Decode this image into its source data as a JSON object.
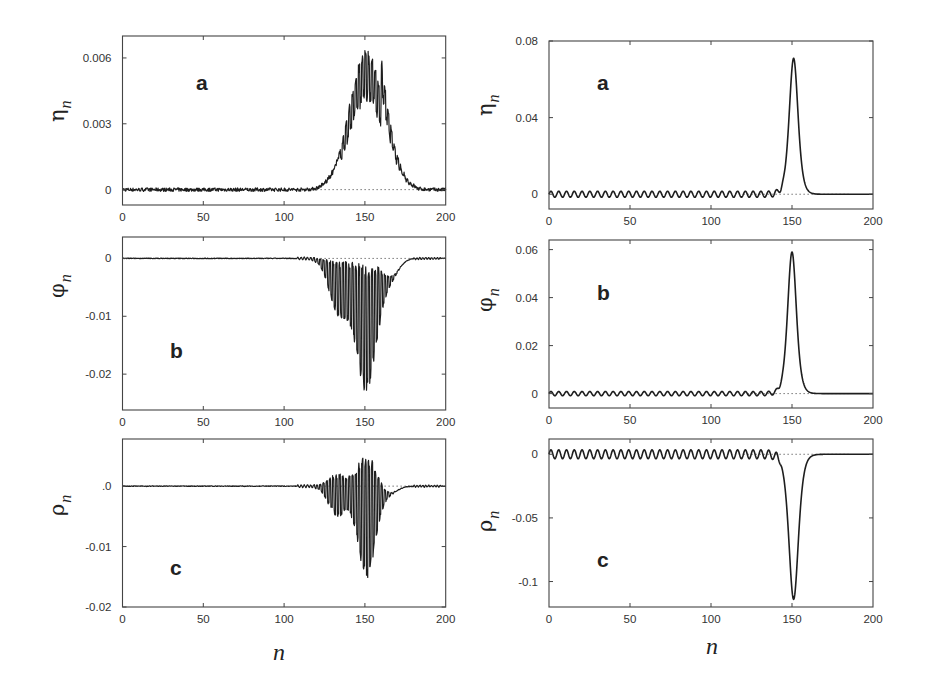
{
  "figure": {
    "xlabel": "n",
    "columns": [
      "left",
      "right"
    ]
  },
  "chart_data": [
    {
      "id": "left-a",
      "type": "line",
      "panel_letter": "a",
      "ylabel_main": "η",
      "ylabel_sub": "n",
      "xlabel": "",
      "xlim": [
        0,
        200
      ],
      "ylim": [
        -0.0007,
        0.007
      ],
      "xticks": [
        0,
        50,
        100,
        150,
        200
      ],
      "xtick_labels": [
        "0",
        "50",
        "100",
        "150",
        "200"
      ],
      "yticks": [
        0,
        0.003,
        0.006
      ],
      "ytick_labels": [
        "0",
        "0.003",
        "0.006"
      ],
      "zero_reference_line": true,
      "description": "Noisy near-zero baseline for n<120, then jagged oscillating bump peaking ~0.0067 at n≈152, decaying to 0 by n≈180",
      "shape": {
        "kind": "noisy-bump",
        "center": 151,
        "width": 10.5,
        "amplitude": 0.0052,
        "oscillation": 0.0012,
        "period": 2,
        "baseline_noise": 8e-05,
        "tail_start": 160,
        "tail_end": 182
      },
      "x": [
        0,
        20,
        40,
        60,
        80,
        100,
        120,
        125,
        130,
        135,
        140,
        145,
        148,
        150,
        152,
        155,
        158,
        162,
        166,
        170,
        175,
        180,
        190,
        200
      ],
      "y": [
        0,
        0.0001,
        0,
        0.0001,
        0,
        0,
        0.0001,
        0.0003,
        0.0006,
        0.0014,
        0.0025,
        0.0045,
        0.0055,
        0.006,
        0.0067,
        0.0055,
        0.0052,
        0.0035,
        0.0018,
        0.0012,
        0.0004,
        0.0001,
        0,
        0
      ],
      "frame_px": {
        "x0": 122.5,
        "x1": 445.7,
        "top": 36,
        "bottom": 205
      }
    },
    {
      "id": "left-b",
      "type": "line",
      "panel_letter": "b",
      "ylabel_main": "φ",
      "ylabel_sub": "n",
      "xlabel": "",
      "xlim": [
        0,
        200
      ],
      "ylim": [
        -0.0262,
        0.0037
      ],
      "xticks": [
        0,
        50,
        100,
        150,
        200
      ],
      "xtick_labels": [
        "0",
        "50",
        "100",
        "150",
        "200"
      ],
      "yticks": [
        0,
        -0.01,
        -0.02
      ],
      "ytick_labels": [
        "0",
        "-0.01",
        "-0.02"
      ],
      "zero_reference_line": true,
      "description": "Near-zero baseline, then two rapidly oscillating negative lobes: first around n≈130-140 (min ~ -0.008), second around n≈150 reaching ~ -0.023, positive spikes up to ~+0.003",
      "shape": {
        "kind": "oscillating-dip",
        "lobes": [
          {
            "center": 134,
            "width": 6,
            "depth": -0.005,
            "osc": 0.0045
          },
          {
            "center": 151,
            "width": 6.5,
            "depth": -0.012,
            "osc": 0.011
          }
        ],
        "tail_center": 166,
        "tail_depth": -0.003,
        "period": 2
      },
      "x": [
        0,
        50,
        100,
        120,
        128,
        133,
        138,
        143,
        148,
        150,
        152,
        156,
        160,
        165,
        170,
        180,
        190,
        200
      ],
      "y": [
        0,
        0,
        0,
        0,
        -0.002,
        -0.005,
        -0.007,
        -0.006,
        -0.015,
        -0.023,
        -0.022,
        -0.012,
        -0.006,
        -0.003,
        -0.001,
        0,
        0,
        0
      ],
      "frame_px": {
        "x0": 122.5,
        "x1": 445.7,
        "top": 237,
        "bottom": 410
      }
    },
    {
      "id": "left-c",
      "type": "line",
      "panel_letter": "c",
      "ylabel_main": "ρ",
      "ylabel_sub": "n",
      "xlabel": "n",
      "xlim": [
        0,
        200
      ],
      "ylim": [
        -0.02,
        0.0078
      ],
      "xticks": [
        0,
        50,
        100,
        150,
        200
      ],
      "xtick_labels": [
        "0",
        "50",
        "100",
        "150",
        "200"
      ],
      "yticks": [
        0,
        -0.01,
        -0.02
      ],
      "ytick_labels": ".0|-0.01|-0.02",
      "zero_reference_line": true,
      "description": "Near-zero baseline, rapidly oscillating packets around n≈133 (±0.003) and n≈150 (min ~ -0.016, max ~ +0.006)",
      "shape": {
        "kind": "oscillating-dip",
        "lobes": [
          {
            "center": 133,
            "width": 5.5,
            "depth": -0.0015,
            "osc": 0.0035
          },
          {
            "center": 151,
            "width": 5.5,
            "depth": -0.005,
            "osc": 0.0105
          }
        ],
        "tail_center": 165,
        "tail_depth": -0.0012,
        "period": 2
      },
      "x": [
        0,
        50,
        100,
        120,
        128,
        133,
        138,
        143,
        148,
        150,
        152,
        156,
        160,
        165,
        170,
        180,
        190,
        200
      ],
      "y": [
        0,
        0,
        0,
        0,
        0.002,
        0.003,
        -0.004,
        -0.002,
        -0.012,
        0.006,
        -0.016,
        -0.01,
        -0.004,
        -0.002,
        -0.0008,
        0,
        0,
        0
      ],
      "frame_px": {
        "x0": 122.5,
        "x1": 445.7,
        "top": 439,
        "bottom": 607
      }
    },
    {
      "id": "right-a",
      "type": "line",
      "panel_letter": "a",
      "ylabel_main": "η",
      "ylabel_sub": "n",
      "xlabel": "",
      "xlim": [
        0,
        200
      ],
      "ylim": [
        -0.0077,
        0.08
      ],
      "xticks": [
        0,
        50,
        100,
        150,
        200
      ],
      "xtick_labels": [
        "0",
        "50",
        "100",
        "150",
        "200"
      ],
      "yticks": [
        0,
        0.04,
        0.08
      ],
      "ytick_labels": [
        "0",
        "0.04",
        "0.08"
      ],
      "zero_reference_line": true,
      "description": "Small regular sinusoidal ripple (amplitude ~0.0015, period ~4.8) for n<143, then a smooth single peak ~0.071 at n≈151, flat 0 for n>162",
      "shape": {
        "kind": "smooth-peak",
        "center": 151,
        "width": 3.6,
        "amplitude": 0.071,
        "ripple_amp": 0.0016,
        "ripple_period": 4.8,
        "ripple_end": 143
      },
      "x": [
        0,
        50,
        100,
        140,
        144,
        147,
        149,
        151,
        153,
        155,
        158,
        162,
        170,
        200
      ],
      "y": [
        0,
        0,
        0,
        0.001,
        0.006,
        0.03,
        0.06,
        0.071,
        0.06,
        0.03,
        0.006,
        0.0005,
        0,
        0
      ],
      "frame_px": {
        "x0": 549,
        "x1": 873,
        "top": 41,
        "bottom": 209
      }
    },
    {
      "id": "right-b",
      "type": "line",
      "panel_letter": "b",
      "ylabel_main": "φ",
      "ylabel_sub": "n",
      "xlabel": "",
      "xlim": [
        0,
        200
      ],
      "ylim": [
        -0.006,
        0.064
      ],
      "xticks": [
        0,
        50,
        100,
        150,
        200
      ],
      "xtick_labels": [
        "0",
        "50",
        "100",
        "150",
        "200"
      ],
      "yticks": [
        0,
        0.02,
        0.04,
        0.06
      ],
      "ytick_labels": [
        "0",
        "0.02",
        "0.04",
        "0.06"
      ],
      "zero_reference_line": true,
      "description": "Small regular ripple for n<142, smooth single peak ~0.059 at n≈150, flat 0 for n>162",
      "shape": {
        "kind": "smooth-peak",
        "center": 150,
        "width": 3.6,
        "amplitude": 0.059,
        "ripple_amp": 0.0009,
        "ripple_period": 4.8,
        "ripple_end": 142
      },
      "x": [
        0,
        50,
        100,
        140,
        144,
        147,
        149,
        150,
        151,
        153,
        156,
        160,
        170,
        200
      ],
      "y": [
        0,
        0,
        0,
        0.0005,
        0.005,
        0.025,
        0.052,
        0.059,
        0.052,
        0.035,
        0.01,
        0.0008,
        0,
        0
      ],
      "frame_px": {
        "x0": 549,
        "x1": 873,
        "top": 240,
        "bottom": 408
      }
    },
    {
      "id": "right-c",
      "type": "line",
      "panel_letter": "c",
      "ylabel_main": "ρ",
      "ylabel_sub": "n",
      "xlabel": "n",
      "xlim": [
        0,
        200
      ],
      "ylim": [
        -0.12,
        0.012
      ],
      "xticks": [
        0,
        50,
        100,
        150,
        200
      ],
      "xtick_labels": [
        "0",
        "50",
        "100",
        "150",
        "200"
      ],
      "yticks": [
        0,
        -0.05,
        -0.1
      ],
      "ytick_labels": [
        "0",
        "-0.05",
        "-0.1"
      ],
      "zero_reference_line": true,
      "description": "Regular ripple (amplitude ~0.004) for n<141, then smooth single dip to ~ -0.114 at n≈151, flat 0 for n>163",
      "shape": {
        "kind": "smooth-peak",
        "center": 151,
        "width": 3.9,
        "amplitude": -0.114,
        "ripple_amp": 0.0035,
        "ripple_period": 4.8,
        "ripple_end": 141
      },
      "x": [
        0,
        50,
        100,
        140,
        144,
        147,
        149,
        151,
        153,
        155,
        158,
        162,
        170,
        200
      ],
      "y": [
        0,
        0,
        0,
        -0.001,
        -0.008,
        -0.045,
        -0.095,
        -0.114,
        -0.095,
        -0.05,
        -0.012,
        -0.001,
        0,
        0
      ],
      "frame_px": {
        "x0": 549,
        "x1": 873,
        "top": 439,
        "bottom": 607
      }
    }
  ],
  "colors": {
    "line": "#1e1e1e",
    "frame": "#444444",
    "text": "#333333",
    "background": "#ffffff",
    "zero_line": "#777777"
  }
}
